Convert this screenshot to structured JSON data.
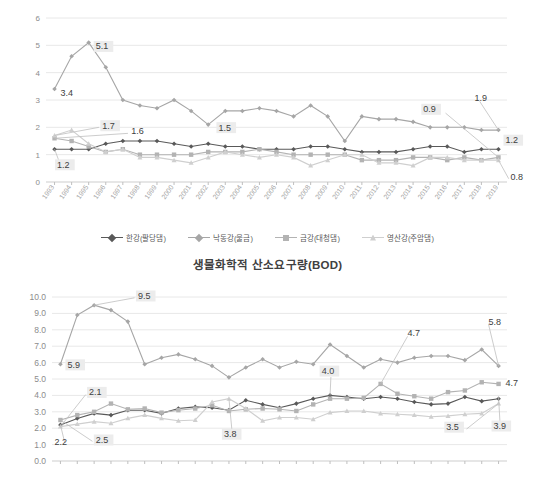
{
  "chart_title": "생물화학적 산소요구량(BOD)",
  "legend": {
    "items": [
      {
        "label": "한강(팔당댐)",
        "key": "han",
        "color": "#595959",
        "marker": "diamond"
      },
      {
        "label": "낙동강(물금)",
        "key": "nak",
        "color": "#a6a6a6",
        "marker": "diamond"
      },
      {
        "label": "금강(대청댐)",
        "key": "geum",
        "color": "#b3b3b3",
        "marker": "square"
      },
      {
        "label": "영산강(주암댐)",
        "key": "yeong",
        "color": "#cfcfcf",
        "marker": "triangle"
      }
    ]
  },
  "chart_data": [
    {
      "id": "chart-top",
      "type": "line",
      "title": "",
      "xlabel": "",
      "ylabel": "",
      "ylim": [
        0,
        6
      ],
      "yticks": [
        "0",
        "1",
        "2",
        "3",
        "4",
        "5",
        "6"
      ],
      "grid": true,
      "legend_position": "bottom",
      "categories": [
        "1993",
        "1994",
        "1995",
        "1996",
        "1997",
        "1998",
        "1999",
        "2000",
        "2001",
        "2002",
        "2003",
        "2004",
        "2005",
        "2006",
        "2007",
        "2008",
        "2009",
        "2010",
        "2011",
        "2012",
        "2013",
        "2014",
        "2015",
        "2016",
        "2017",
        "2018",
        "2019"
      ],
      "series": [
        {
          "name": "한강(팔당댐)",
          "values": [
            1.2,
            1.2,
            1.2,
            1.4,
            1.5,
            1.5,
            1.5,
            1.4,
            1.3,
            1.4,
            1.3,
            1.3,
            1.2,
            1.2,
            1.2,
            1.3,
            1.3,
            1.2,
            1.1,
            1.1,
            1.1,
            1.2,
            1.3,
            1.3,
            1.1,
            1.2,
            1.2
          ]
        },
        {
          "name": "낙동강(물금)",
          "values": [
            3.4,
            4.6,
            5.1,
            4.2,
            3.0,
            2.8,
            2.7,
            3.0,
            2.6,
            2.1,
            2.6,
            2.6,
            2.7,
            2.6,
            2.4,
            2.8,
            2.4,
            1.5,
            2.4,
            2.3,
            2.3,
            2.2,
            2.0,
            2.0,
            2.0,
            1.9,
            1.9
          ]
        },
        {
          "name": "금강(대청댐)",
          "values": [
            1.6,
            1.5,
            1.3,
            1.1,
            1.2,
            1.0,
            1.0,
            1.0,
            1.0,
            1.1,
            1.1,
            1.1,
            1.2,
            1.1,
            1.0,
            1.0,
            1.0,
            1.0,
            0.8,
            0.8,
            0.8,
            0.9,
            0.9,
            0.8,
            0.9,
            0.8,
            0.9
          ]
        },
        {
          "name": "영산강(주암댐)",
          "values": [
            1.7,
            1.9,
            1.4,
            1.1,
            1.2,
            0.9,
            0.9,
            0.8,
            0.7,
            0.9,
            1.1,
            1.0,
            0.9,
            1.0,
            0.9,
            0.6,
            0.8,
            1.0,
            1.0,
            0.7,
            0.7,
            0.6,
            0.9,
            0.9,
            0.8,
            0.8,
            0.8
          ]
        }
      ],
      "callouts": [
        {
          "text": "3.4",
          "highlight": false
        },
        {
          "text": "5.1",
          "highlight": true
        },
        {
          "text": "1.7",
          "highlight": true
        },
        {
          "text": "1.6",
          "highlight": false
        },
        {
          "text": "1.5",
          "highlight": true
        },
        {
          "text": "1.2",
          "highlight": true
        },
        {
          "text": "0.9",
          "highlight": true
        },
        {
          "text": "1.9",
          "highlight": false
        },
        {
          "text": "1.2",
          "highlight": true
        },
        {
          "text": "0.8",
          "highlight": false
        }
      ]
    },
    {
      "id": "chart-bottom",
      "type": "line",
      "title": "",
      "xlabel": "",
      "ylabel": "",
      "ylim": [
        0,
        10
      ],
      "yticks": [
        "0.0",
        "1.0",
        "2.0",
        "3.0",
        "4.0",
        "5.0",
        "6.0",
        "7.0",
        "8.0",
        "9.0",
        "10.0"
      ],
      "grid": true,
      "legend_position": "bottom",
      "categories": [
        "1993",
        "1994",
        "1995",
        "1996",
        "1997",
        "1998",
        "1999",
        "2000",
        "2001",
        "2002",
        "2003",
        "2004",
        "2005",
        "2006",
        "2007",
        "2008",
        "2009",
        "2010",
        "2011",
        "2012",
        "2013",
        "2014",
        "2015",
        "2016",
        "2017",
        "2018",
        "2019"
      ],
      "series": [
        {
          "name": "한강(팔당댐)",
          "values": [
            2.2,
            2.6,
            2.9,
            2.8,
            3.1,
            3.1,
            2.9,
            3.2,
            3.3,
            3.25,
            3.1,
            3.7,
            3.45,
            3.25,
            3.5,
            3.8,
            4.0,
            3.9,
            3.8,
            3.9,
            3.8,
            3.6,
            3.45,
            3.5,
            3.9,
            3.65,
            3.8,
            3.9
          ]
        },
        {
          "name": "낙동강(물금)",
          "values": [
            5.9,
            8.9,
            9.5,
            9.2,
            8.5,
            5.9,
            6.3,
            6.5,
            6.2,
            5.8,
            5.1,
            5.7,
            6.2,
            5.7,
            6.05,
            5.9,
            7.1,
            6.4,
            5.7,
            6.2,
            6.0,
            6.3,
            6.4,
            6.4,
            6.15,
            6.8,
            5.8
          ]
        },
        {
          "name": "금강(대청댐)",
          "values": [
            2.5,
            2.8,
            3.0,
            3.5,
            3.15,
            3.2,
            2.95,
            3.1,
            3.2,
            3.4,
            3.05,
            3.15,
            3.2,
            3.15,
            3.05,
            3.45,
            3.8,
            3.8,
            3.85,
            4.7,
            4.1,
            3.95,
            3.8,
            4.2,
            4.3,
            4.8,
            4.7
          ]
        },
        {
          "name": "영산강(주암댐)",
          "values": [
            2.1,
            2.25,
            2.4,
            2.3,
            2.6,
            2.8,
            2.6,
            2.45,
            2.5,
            3.6,
            3.8,
            3.2,
            2.45,
            2.65,
            2.65,
            2.55,
            2.95,
            3.05,
            3.05,
            2.9,
            2.85,
            2.8,
            2.7,
            2.75,
            2.85,
            2.9,
            3.5
          ]
        }
      ],
      "callouts": [
        {
          "text": "9.5",
          "highlight": true
        },
        {
          "text": "5.9",
          "highlight": true
        },
        {
          "text": "2.1",
          "highlight": true
        },
        {
          "text": "2.2",
          "highlight": false
        },
        {
          "text": "2.5",
          "highlight": true
        },
        {
          "text": "3.8",
          "highlight": true
        },
        {
          "text": "4.0",
          "highlight": true
        },
        {
          "text": "4.7",
          "highlight": false
        },
        {
          "text": "5.8",
          "highlight": false
        },
        {
          "text": "4.7",
          "highlight": false
        },
        {
          "text": "3.5",
          "highlight": true
        },
        {
          "text": "3.9",
          "highlight": true
        }
      ]
    }
  ]
}
